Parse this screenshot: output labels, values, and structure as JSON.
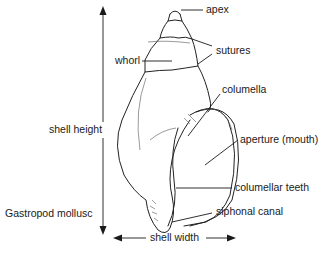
{
  "figure": {
    "title_cropped": "",
    "caption": "Gastropod mollusc",
    "colors": {
      "ink": "#1a1a1a",
      "background": "#ffffff"
    }
  },
  "labels": {
    "apex": "apex",
    "sutures": "sutures",
    "whorl": "whorl",
    "columella": "columella",
    "aperture": "aperture (mouth)",
    "columellar_teeth": "columellar teeth",
    "siphonal_canal": "siphonal canal",
    "shell_height": "shell height",
    "shell_width": "shell width"
  }
}
